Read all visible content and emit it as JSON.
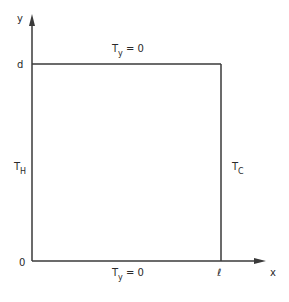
{
  "diagram": {
    "type": "rectangular domain with boundary conditions",
    "axes": {
      "x_label": "x",
      "y_label": "y"
    },
    "ticks": {
      "origin": "0",
      "y_top": "d",
      "x_right": "ℓ"
    },
    "boundaries": {
      "top": {
        "main": "T",
        "sub": "y",
        "rest": " = 0"
      },
      "bottom": {
        "main": "T",
        "sub": "y",
        "rest": " = 0"
      },
      "left": {
        "main": "T",
        "sub": "H"
      },
      "right": {
        "main": "T",
        "sub": "C"
      }
    },
    "colors": {
      "line": "#3a3a3a",
      "text": "#2a2a2a",
      "background": "#ffffff"
    }
  }
}
